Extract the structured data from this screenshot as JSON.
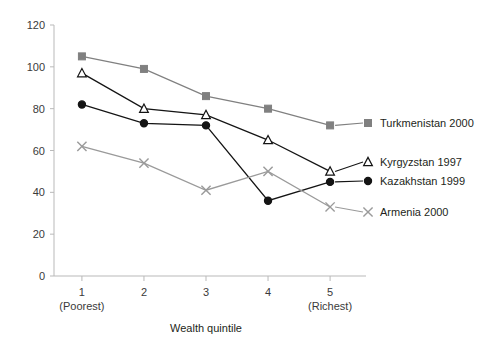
{
  "chart_data": {
    "type": "line",
    "title": "",
    "subtitle": "",
    "xlabel": "Wealth quintile",
    "ylabel": "",
    "x": [
      1,
      2,
      3,
      4,
      5
    ],
    "categories": [
      "1",
      "2",
      "3",
      "4",
      "5"
    ],
    "xtick_sublabels": [
      "(Poorest)",
      "",
      "",
      "",
      "(Richest)"
    ],
    "xlim": [
      0.55,
      5.45
    ],
    "ylim": [
      0,
      120
    ],
    "yticks": [
      0,
      20,
      40,
      60,
      80,
      100,
      120
    ],
    "ytick_labels": [
      "0",
      "20",
      "40",
      "60",
      "80",
      "100",
      "120"
    ],
    "grid": false,
    "legend_position": "right-inline",
    "series": [
      {
        "name": "Turkmenistan 2000",
        "values": [
          105,
          99,
          86,
          80,
          72
        ],
        "color": "#808080",
        "marker": "square",
        "marker_filled": true
      },
      {
        "name": "Kyrgyzstan 1997",
        "values": [
          97,
          80,
          77,
          65,
          50
        ],
        "color": "#141414",
        "marker": "triangle",
        "marker_filled": false
      },
      {
        "name": "Kazakhstan 1999",
        "values": [
          82,
          73,
          72,
          36,
          45
        ],
        "color": "#141414",
        "marker": "circle",
        "marker_filled": true
      },
      {
        "name": "Armenia 2000",
        "values": [
          62,
          54,
          41,
          50,
          33
        ],
        "color": "#9a9a9a",
        "marker": "cross",
        "marker_filled": false
      }
    ]
  },
  "legend": {
    "items": [
      {
        "label": "Turkmenistan 2000"
      },
      {
        "label": "Kyrgyzstan 1997"
      },
      {
        "label": "Kazakhstan 1999"
      },
      {
        "label": "Armenia 2000"
      }
    ]
  }
}
